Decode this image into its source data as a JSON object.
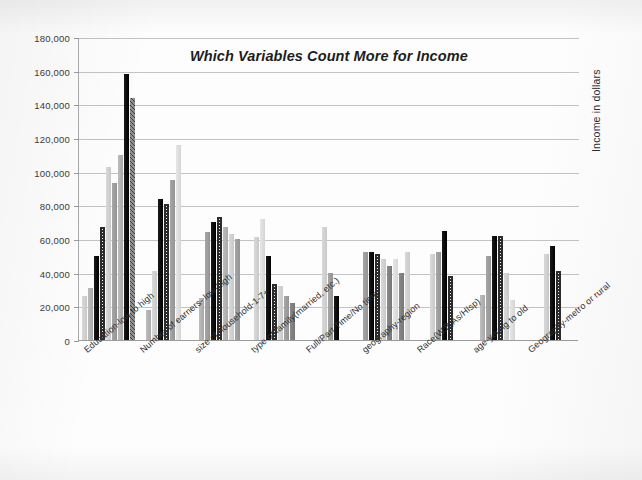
{
  "chart_data": {
    "type": "bar",
    "title": "Which Variables Count More for Income",
    "subtitle": "",
    "xlabel": "",
    "ylabel": "Income in dollars",
    "ylim": [
      0,
      180000
    ],
    "ytick_step": 20000,
    "ytick_labels": [
      "180,000",
      "160,000",
      "140,000",
      "120,000",
      "100,000",
      "80,000",
      "60,000",
      "40,000",
      "20,000",
      "0"
    ],
    "ytick_values": [
      180000,
      160000,
      140000,
      120000,
      100000,
      80000,
      60000,
      40000,
      20000,
      0
    ],
    "grid": true,
    "legend": "none",
    "categories": [
      "Education-low to high",
      "Number of earners- low-high",
      "size of household-1-7+",
      "type of family(married, etc.)",
      "Full/Part Time/No time",
      "geography-region",
      "Race(W,B,As/HIsp)",
      "age-young to old",
      "Geography-metro or rural"
    ],
    "groups": [
      {
        "category": "Education-low to high",
        "bars": [
          {
            "value": 26000,
            "fill": "lightgrey"
          },
          {
            "value": 31000,
            "fill": "grey"
          },
          {
            "value": 50000,
            "fill": "black"
          },
          {
            "value": 67000,
            "fill": "hatch"
          },
          {
            "value": 103000,
            "fill": "lightgrey"
          },
          {
            "value": 93000,
            "fill": "midgrey"
          },
          {
            "value": 110000,
            "fill": "grey"
          },
          {
            "value": 158000,
            "fill": "black"
          },
          {
            "value": 144000,
            "fill": "dkhatch"
          }
        ]
      },
      {
        "category": "Number of earners- low-high",
        "bars": [
          {
            "value": 18000,
            "fill": "grey"
          },
          {
            "value": 41000,
            "fill": "lightgrey"
          },
          {
            "value": 84000,
            "fill": "black"
          },
          {
            "value": 81000,
            "fill": "hatch"
          },
          {
            "value": 95000,
            "fill": "midgrey"
          },
          {
            "value": 116000,
            "fill": "vlight"
          }
        ]
      },
      {
        "category": "size of household-1-7+",
        "bars": [
          {
            "value": 25000,
            "fill": "grey"
          },
          {
            "value": 64000,
            "fill": "midgrey"
          },
          {
            "value": 70000,
            "fill": "black"
          },
          {
            "value": 73000,
            "fill": "hatch"
          },
          {
            "value": 67000,
            "fill": "grey"
          },
          {
            "value": 63000,
            "fill": "lightgrey"
          },
          {
            "value": 60000,
            "fill": "midgrey"
          }
        ]
      },
      {
        "category": "type of family(married, etc.)",
        "bars": [
          {
            "value": 61000,
            "fill": "lightgrey"
          },
          {
            "value": 72000,
            "fill": "vlight"
          },
          {
            "value": 50000,
            "fill": "black"
          },
          {
            "value": 33000,
            "fill": "hatch"
          },
          {
            "value": 32000,
            "fill": "lightgrey"
          },
          {
            "value": 26000,
            "fill": "midgrey"
          },
          {
            "value": 22000,
            "fill": "darkgrey"
          }
        ]
      },
      {
        "category": "Full/Part Time/No time",
        "bars": [
          {
            "value": 67000,
            "fill": "lightgrey"
          },
          {
            "value": 40000,
            "fill": "midgrey"
          },
          {
            "value": 26000,
            "fill": "black"
          }
        ]
      },
      {
        "category": "geography-region",
        "bars": [
          {
            "value": 52000,
            "fill": "midgrey"
          },
          {
            "value": 52000,
            "fill": "black"
          },
          {
            "value": 51000,
            "fill": "hatch"
          },
          {
            "value": 48000,
            "fill": "lightgrey"
          },
          {
            "value": 44000,
            "fill": "darkgrey"
          },
          {
            "value": 48000,
            "fill": "vlight"
          },
          {
            "value": 40000,
            "fill": "darkgrey"
          },
          {
            "value": 52000,
            "fill": "lightgrey"
          }
        ]
      },
      {
        "category": "Race(W,B,As/HIsp)",
        "bars": [
          {
            "value": 51000,
            "fill": "lightgrey"
          },
          {
            "value": 52000,
            "fill": "midgrey"
          },
          {
            "value": 65000,
            "fill": "black"
          },
          {
            "value": 38000,
            "fill": "hatch"
          }
        ]
      },
      {
        "category": "age-young to old",
        "bars": [
          {
            "value": 27000,
            "fill": "grey"
          },
          {
            "value": 50000,
            "fill": "midgrey"
          },
          {
            "value": 62000,
            "fill": "black"
          },
          {
            "value": 62000,
            "fill": "hatch"
          },
          {
            "value": 40000,
            "fill": "lightgrey"
          },
          {
            "value": 24000,
            "fill": "vlight"
          }
        ]
      },
      {
        "category": "Geography-metro or rural",
        "bars": [
          {
            "value": 51000,
            "fill": "lightgrey"
          },
          {
            "value": 56000,
            "fill": "black"
          },
          {
            "value": 41000,
            "fill": "hatch"
          }
        ]
      }
    ]
  },
  "axis": {
    "y_caption": "Income in dollars"
  }
}
